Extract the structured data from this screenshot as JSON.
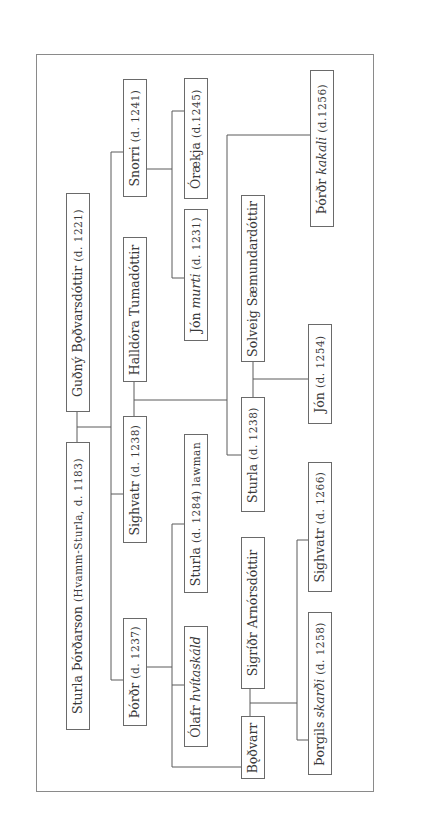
{
  "diagram": {
    "type": "genealogical-tree",
    "orientation": "rotated-90-ccw",
    "people": [
      {
        "id": "guthny",
        "name": "Guðný Bǫðvarsdóttir",
        "dates": "(d. 1221)"
      },
      {
        "id": "sturla_thordarson",
        "name": "Sturla Þórðarson",
        "dates": "(Hvamm-Sturla, d. 1183)"
      },
      {
        "id": "snorri",
        "name": "Snorri",
        "dates": "(d. 1241)"
      },
      {
        "id": "halldora",
        "name": "Halldóra Tumadóttir",
        "dates": ""
      },
      {
        "id": "sighvatr",
        "name": "Sighvatr",
        "dates": "(d. 1238)"
      },
      {
        "id": "thordr",
        "name": "Þórðr",
        "dates": "(d. 1237)"
      },
      {
        "id": "oraekja",
        "name": "Órækja",
        "dates": "(d.1245)"
      },
      {
        "id": "jon_murti_pre",
        "name": "Jón ",
        "epithet": "murti",
        "dates": " (d. 1231)"
      },
      {
        "id": "sturla_lawman",
        "name": "Sturla",
        "dates": "(d. 1284) lawman"
      },
      {
        "id": "olafr_pre",
        "name": "Ólafr ",
        "epithet": "hvítaskáld",
        "dates": ""
      },
      {
        "id": "solveig",
        "name": "Solveig Sæmundardóttir",
        "dates": ""
      },
      {
        "id": "sturla_1238",
        "name": "Sturla",
        "dates": "(d. 1238)"
      },
      {
        "id": "sigridr",
        "name": "Sigríðr Arnórsdóttir",
        "dates": ""
      },
      {
        "id": "bodvarr",
        "name": "Bǫðvarr",
        "dates": ""
      },
      {
        "id": "thordr_kakali_pre",
        "name": "Þórðr ",
        "epithet": "kakali",
        "dates": " (d.1256)"
      },
      {
        "id": "jon_1254",
        "name": "Jón",
        "dates": "(d. 1254)"
      },
      {
        "id": "sighvatr_1266",
        "name": "Sighvatr",
        "dates": "(d. 1266)"
      },
      {
        "id": "thorgils_pre",
        "name": "Þorgils ",
        "epithet": "skarði",
        "dates": " (d. 1258)"
      }
    ],
    "relations": [
      {
        "couple": [
          "sturla_thordarson",
          "guthny"
        ],
        "children": [
          "snorri",
          "sighvatr",
          "thordr"
        ]
      },
      {
        "couple": [
          "sighvatr",
          "halldora"
        ],
        "children": [
          "sturla_1238",
          "thordr_kakali_pre"
        ]
      },
      {
        "parent": "snorri",
        "children": [
          "oraekja",
          "jon_murti_pre"
        ]
      },
      {
        "parent": "thordr",
        "children": [
          "sturla_lawman",
          "olafr_pre",
          "bodvarr"
        ]
      },
      {
        "couple": [
          "sturla_1238",
          "solveig"
        ],
        "children": [
          "jon_1254"
        ]
      },
      {
        "couple": [
          "bodvarr",
          "sigridr"
        ],
        "children": [
          "sighvatr_1266",
          "thorgils_pre"
        ]
      }
    ],
    "colors": {
      "line": "#5a5a5a",
      "frame": "#8a8a8a",
      "text": "#3a3a3a"
    }
  }
}
